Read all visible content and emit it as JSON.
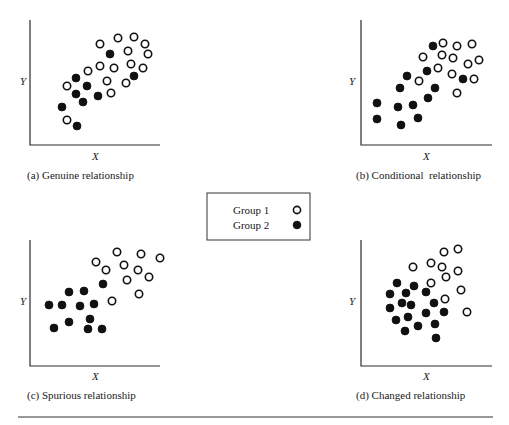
{
  "figure": {
    "separator": {
      "x1": 18,
      "x2": 493,
      "y": 417
    }
  },
  "legend": {
    "box": {
      "x": 207,
      "y": 193,
      "w": 103,
      "h": 47
    },
    "items": [
      {
        "label": "Group 1",
        "marker": "open",
        "text_x": 233,
        "y": 210,
        "marker_x": 297
      },
      {
        "label": "Group 2",
        "marker": "filled",
        "text_x": 233,
        "y": 225,
        "marker_x": 297
      }
    ]
  },
  "chart_data": [
    {
      "type": "scatter",
      "id": "a",
      "title": "(a) Genuine relationship",
      "xlabel": "X",
      "ylabel": "Y",
      "frame": {
        "x0": 30,
        "y0": 20,
        "x1": 160,
        "y1": 145
      },
      "caption_pos": {
        "x": 27,
        "y": 179
      },
      "xlabel_pos": {
        "x": 92,
        "y": 160
      },
      "ylabel_pos": {
        "x": 20,
        "y": 85
      },
      "series": [
        {
          "name": "Group 1",
          "marker": "open",
          "points": [
            [
              100,
              44
            ],
            [
              118,
              38
            ],
            [
              134,
              37
            ],
            [
              145,
              44
            ],
            [
              148,
              54
            ],
            [
              128,
              51
            ],
            [
              100,
              66
            ],
            [
              114,
              68
            ],
            [
              131,
              64
            ],
            [
              143,
              68
            ],
            [
              88,
              71
            ],
            [
              67,
              86
            ],
            [
              107,
              81
            ],
            [
              126,
              83
            ],
            [
              111,
              93
            ],
            [
              67,
              120
            ]
          ]
        },
        {
          "name": "Group 2",
          "marker": "filled",
          "points": [
            [
              110,
              54
            ],
            [
              76,
              78
            ],
            [
              87,
              86
            ],
            [
              134,
              76
            ],
            [
              76,
              94
            ],
            [
              83,
              102
            ],
            [
              98,
              96
            ],
            [
              62,
              107
            ],
            [
              77,
              126
            ]
          ]
        }
      ]
    },
    {
      "type": "scatter",
      "id": "b",
      "title": "(b) Conditional  relationship",
      "xlabel": "X",
      "ylabel": "Y",
      "frame": {
        "x0": 361,
        "y0": 20,
        "x1": 492,
        "y1": 145
      },
      "caption_pos": {
        "x": 356,
        "y": 179
      },
      "xlabel_pos": {
        "x": 423,
        "y": 160
      },
      "ylabel_pos": {
        "x": 349,
        "y": 85
      },
      "series": [
        {
          "name": "Group 1",
          "marker": "open",
          "points": [
            [
              443,
              43
            ],
            [
              457,
              46
            ],
            [
              472,
              44
            ],
            [
              423,
              57
            ],
            [
              442,
              55
            ],
            [
              453,
              58
            ],
            [
              479,
              60
            ],
            [
              468,
              64
            ],
            [
              438,
              68
            ],
            [
              452,
              74
            ],
            [
              474,
              79
            ],
            [
              419,
              81
            ],
            [
              457,
              93
            ]
          ]
        },
        {
          "name": "Group 2",
          "marker": "filled",
          "points": [
            [
              433,
              46
            ],
            [
              427,
              71
            ],
            [
              407,
              76
            ],
            [
              400,
              88
            ],
            [
              435,
              88
            ],
            [
              428,
              98
            ],
            [
              463,
              79
            ],
            [
              377,
              103
            ],
            [
              398,
              107
            ],
            [
              413,
              105
            ],
            [
              377,
              119
            ],
            [
              418,
              118
            ],
            [
              401,
              125
            ]
          ]
        }
      ]
    },
    {
      "type": "scatter",
      "id": "c",
      "title": "(c) Spurious relationship",
      "xlabel": "X",
      "ylabel": "Y",
      "frame": {
        "x0": 30,
        "y0": 240,
        "x1": 160,
        "y1": 366
      },
      "caption_pos": {
        "x": 27,
        "y": 399
      },
      "xlabel_pos": {
        "x": 92,
        "y": 380
      },
      "ylabel_pos": {
        "x": 20,
        "y": 305
      },
      "series": [
        {
          "name": "Group 1",
          "marker": "open",
          "points": [
            [
              117,
              252
            ],
            [
              141,
              254
            ],
            [
              160,
              258
            ],
            [
              96,
              262
            ],
            [
              124,
              265
            ],
            [
              106,
              270
            ],
            [
              138,
              270
            ],
            [
              149,
              277
            ],
            [
              127,
              280
            ],
            [
              139,
              294
            ],
            [
              112,
              301
            ]
          ]
        },
        {
          "name": "Group 2",
          "marker": "filled",
          "points": [
            [
              103,
              284
            ],
            [
              69,
              292
            ],
            [
              84,
              291
            ],
            [
              49,
              305
            ],
            [
              62,
              305
            ],
            [
              80,
              306
            ],
            [
              94,
              304
            ],
            [
              90,
              319
            ],
            [
              69,
              322
            ],
            [
              54,
              328
            ],
            [
              88,
              329
            ],
            [
              102,
              329
            ]
          ]
        }
      ]
    },
    {
      "type": "scatter",
      "id": "d",
      "title": "(d) Changed relationship",
      "xlabel": "X",
      "ylabel": "Y",
      "frame": {
        "x0": 361,
        "y0": 240,
        "x1": 492,
        "y1": 366
      },
      "caption_pos": {
        "x": 356,
        "y": 399
      },
      "xlabel_pos": {
        "x": 423,
        "y": 380
      },
      "ylabel_pos": {
        "x": 349,
        "y": 305
      },
      "series": [
        {
          "name": "Group 1",
          "marker": "open",
          "points": [
            [
              444,
              252
            ],
            [
              458,
              249
            ],
            [
              413,
              267
            ],
            [
              431,
              263
            ],
            [
              442,
              267
            ],
            [
              458,
              271
            ],
            [
              446,
              277
            ],
            [
              431,
              283
            ],
            [
              461,
              290
            ],
            [
              445,
              299
            ],
            [
              467,
              312
            ]
          ]
        },
        {
          "name": "Group 2",
          "marker": "filled",
          "points": [
            [
              397,
              283
            ],
            [
              414,
              286
            ],
            [
              390,
              294
            ],
            [
              406,
              293
            ],
            [
              426,
              292
            ],
            [
              402,
              303
            ],
            [
              411,
              305
            ],
            [
              434,
              303
            ],
            [
              390,
              308
            ],
            [
              426,
              313
            ],
            [
              444,
              312
            ],
            [
              408,
              317
            ],
            [
              396,
              320
            ],
            [
              435,
              324
            ],
            [
              418,
              326
            ],
            [
              405,
              331
            ],
            [
              436,
              338
            ]
          ]
        }
      ]
    }
  ]
}
